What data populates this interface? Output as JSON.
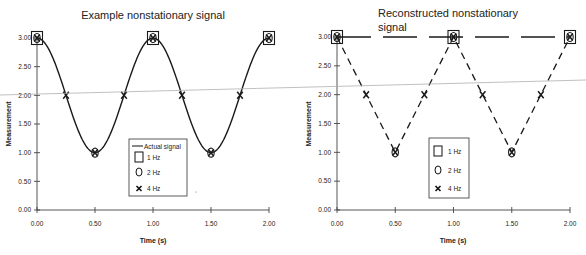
{
  "chart_data": [
    {
      "type": "line",
      "title": "Example nonstationary signal",
      "xlabel": "Time (s)",
      "ylabel": "Measurement",
      "xlim": [
        0,
        2
      ],
      "ylim": [
        0,
        3
      ],
      "xticks": [
        "0.00",
        "0.50",
        "1.00",
        "1.50",
        "2.00"
      ],
      "yticks": [
        "0.00",
        "0.50",
        "1.00",
        "1.50",
        "2.00",
        "2.50",
        "3.00"
      ],
      "grid": false,
      "legend_position": "center-bottom inside plot",
      "series": [
        {
          "name": "Actual signal",
          "style": "solid-line",
          "function": "2 + cos(2*pi*t)",
          "x": [
            0,
            0.25,
            0.5,
            0.75,
            1.0,
            1.25,
            1.5,
            1.75,
            2.0
          ],
          "values": [
            3,
            2,
            1,
            2,
            3,
            2,
            1,
            2,
            3
          ]
        },
        {
          "name": "1 Hz",
          "marker": "square",
          "x": [
            0,
            1,
            2
          ],
          "values": [
            3,
            3,
            3
          ]
        },
        {
          "name": "2 Hz",
          "marker": "circle",
          "x": [
            0,
            0.5,
            1,
            1.5,
            2
          ],
          "values": [
            3,
            1,
            3,
            1,
            3
          ]
        },
        {
          "name": "4 Hz",
          "marker": "x",
          "x": [
            0,
            0.25,
            0.5,
            0.75,
            1,
            1.25,
            1.5,
            1.75,
            2
          ],
          "values": [
            3,
            2,
            1,
            2,
            3,
            2,
            1,
            2,
            3
          ]
        }
      ],
      "legend": [
        "Actual signal",
        "1 Hz",
        "2 Hz",
        "4 Hz"
      ]
    },
    {
      "type": "line",
      "title": "Reconstructed nonstationary signal",
      "xlabel": "Time (s)",
      "ylabel": "Measurement",
      "xlim": [
        0,
        2
      ],
      "ylim": [
        0,
        3
      ],
      "xticks": [
        "0.00",
        "0.50",
        "1.00",
        "1.50",
        "2.00"
      ],
      "yticks": [
        "0.00",
        "0.50",
        "1.00",
        "1.50",
        "2.00",
        "2.50",
        "3.00"
      ],
      "grid": false,
      "legend_position": "center-bottom inside plot",
      "series": [
        {
          "name": "1 Hz",
          "marker": "square",
          "style": "long-dash line",
          "x": [
            0,
            1,
            2
          ],
          "values": [
            3,
            3,
            3
          ]
        },
        {
          "name": "2 Hz",
          "marker": "circle",
          "style": "short-dash line",
          "x": [
            0,
            0.5,
            1,
            1.5,
            2
          ],
          "values": [
            3,
            1,
            3,
            1,
            3
          ]
        },
        {
          "name": "4 Hz",
          "marker": "x",
          "x": [
            0,
            0.25,
            0.5,
            0.75,
            1,
            1.25,
            1.5,
            1.75,
            2
          ],
          "values": [
            3,
            2,
            1,
            2,
            3,
            2,
            1,
            2,
            3
          ]
        }
      ],
      "legend": [
        "1 Hz",
        "2 Hz",
        "4 Hz"
      ]
    }
  ],
  "charts": {
    "left": {
      "title": "Example nonstationary signal",
      "xlabel": "Time (s)",
      "ylabel": "Measurement",
      "legend": {
        "actual": "Actual signal",
        "hz1": "1 Hz",
        "hz2": "2 Hz",
        "hz4": "4 Hz"
      }
    },
    "right": {
      "title_line1": "Reconstructed nonstationary",
      "title_line2": "signal",
      "xlabel": "Time (s)",
      "ylabel": "Measurement",
      "legend": {
        "hz1": "1 Hz",
        "hz2": "2 Hz",
        "hz4": "4 Hz"
      }
    },
    "colors": {
      "ink": "#1a1a1a",
      "axis": "#444444",
      "scan_line": "#b0b0b0"
    }
  }
}
